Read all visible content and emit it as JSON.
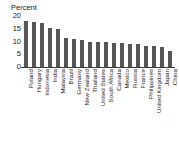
{
  "chart_data": {
    "type": "bar",
    "title": "",
    "subtitle": "",
    "xlabel": "",
    "ylabel": "Percent",
    "ylim": [
      0,
      20
    ],
    "yticks": [
      0,
      5,
      10,
      15,
      20
    ],
    "grid": false,
    "legend": null,
    "bar_color": "#565656",
    "axis_color": "#3b3b3b",
    "categories": [
      "Poland",
      "Hungary",
      "Indonesia",
      "India",
      "Malaysia",
      "Brazil",
      "Germany",
      "New Zealand",
      "Thailand",
      "United States",
      "South Africa",
      "Canada",
      "Mexico",
      "Russia",
      "France",
      "Philippines",
      "United Kingdom",
      "Japan",
      "China"
    ],
    "values": [
      18.0,
      17.8,
      17.2,
      15.2,
      15.1,
      11.2,
      11.1,
      10.6,
      10.0,
      9.7,
      9.7,
      9.4,
      9.3,
      9.2,
      9.1,
      8.3,
      8.1,
      8.0,
      6.1
    ]
  }
}
